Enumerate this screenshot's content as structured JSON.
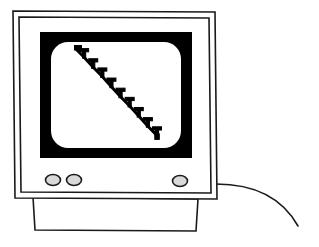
{
  "illustration": {
    "title": "CRT computer monitor displaying a declining chart",
    "style": "black-and-white line art",
    "background_color": "#ffffff",
    "line_color": "#1a1a1a",
    "bezel_color": "#000000",
    "screen_color": "#ffffff",
    "button_fill_color": "#d9d9d9"
  },
  "monitor": {
    "label": "crt-monitor",
    "outer_case_label": "monitor-outer-case",
    "inner_case_label": "monitor-inner-case",
    "bezel_label": "screen-bezel",
    "screen_label": "screen-display",
    "stand_label": "monitor-stand",
    "cable_label": "power-cable",
    "buttons": [
      {
        "name": "power-button",
        "label": "Power",
        "cx": 53,
        "cy": 180,
        "rx": 7.5,
        "ry": 5.5
      },
      {
        "name": "brightness-button",
        "label": "Brightness",
        "cx": 74,
        "cy": 180,
        "rx": 7.5,
        "ry": 5.5
      },
      {
        "name": "contrast-button",
        "label": "Contrast",
        "cx": 180,
        "cy": 181,
        "rx": 7.5,
        "ry": 5.5
      }
    ]
  },
  "chart_data": {
    "type": "line",
    "title": "",
    "subtitle": "",
    "xlabel": "",
    "ylabel": "",
    "grid": false,
    "legend": null,
    "axis_visible": false,
    "marker": "error-bar-tick",
    "marker_count": 9,
    "line_style": "solid",
    "line_width_px": 3,
    "series": [
      {
        "name": "downward-trend",
        "x": [
          0,
          1,
          2,
          3,
          4,
          5,
          6,
          7,
          8,
          9
        ],
        "values": [
          100,
          90,
          79,
          69,
          58,
          47,
          37,
          26,
          15,
          5
        ],
        "color": "#000000"
      }
    ],
    "xlim": [
      0,
      9
    ],
    "ylim": [
      0,
      100
    ],
    "annotations": []
  }
}
